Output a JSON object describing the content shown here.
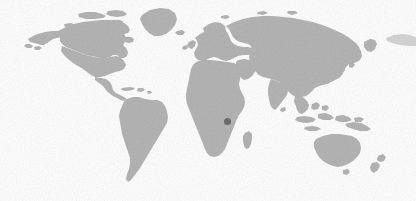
{
  "figure": {
    "type": "locator-map",
    "title": "World locator map",
    "width": 416,
    "height": 201,
    "background_color": "#ffffff"
  },
  "map": {
    "projection": "equirectangular",
    "land_color": "#b5b5b5",
    "ocean_color": "#ffffff",
    "border_color": "#ffffff",
    "antarctica_shown": false,
    "graticule_shown": false,
    "labels_shown": false
  },
  "marker": {
    "name": "highlighted-location",
    "color": "#6a6a6a",
    "shape": "circle",
    "diameter_px": 7,
    "x_px": 227,
    "y_px": 121,
    "region": "East Africa - Great Lakes"
  },
  "landmasses": [
    {
      "name": "north-america"
    },
    {
      "name": "greenland"
    },
    {
      "name": "south-america"
    },
    {
      "name": "europe"
    },
    {
      "name": "africa"
    },
    {
      "name": "asia"
    },
    {
      "name": "southeast-asia-islands"
    },
    {
      "name": "australia"
    },
    {
      "name": "new-zealand"
    },
    {
      "name": "madagascar"
    },
    {
      "name": "japan"
    },
    {
      "name": "british-isles"
    },
    {
      "name": "iceland"
    },
    {
      "name": "caribbean"
    }
  ]
}
